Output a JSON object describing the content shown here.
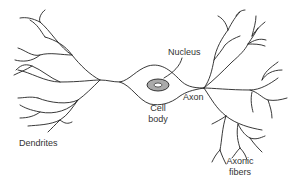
{
  "diagram": {
    "type": "neuron anatomy",
    "labels": {
      "nucleus": "Nucleus",
      "cell_body_line1": "Cell",
      "cell_body_line2": "body",
      "axon": "Axon",
      "dendrites": "Dendrites",
      "axonic_fibers_line1": "Axonic",
      "axonic_fibers_line2": "fibers"
    },
    "colors": {
      "line": "#222222",
      "nucleus_fill": "#aaaaaa",
      "background": "#ffffff"
    }
  }
}
